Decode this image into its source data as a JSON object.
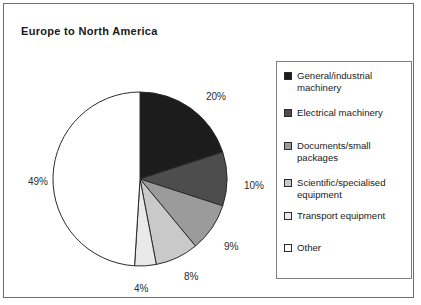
{
  "chart_data": {
    "type": "pie",
    "title": "Europe to North America",
    "xlabel": "",
    "ylabel": "",
    "legend_position": "right",
    "grid": false,
    "unit": "%",
    "categories": [
      "General/industrial machinery",
      "Electrical machinery",
      "Documents/small packages",
      "Scientific/specialised equipment",
      "Transport equipment",
      "Other"
    ],
    "values": [
      20,
      10,
      9,
      8,
      4,
      49
    ],
    "value_labels": [
      "20%",
      "10%",
      "9%",
      "8%",
      "4%",
      "49%"
    ],
    "colors": [
      "#1c1c1c",
      "#4d4d4d",
      "#9b9b9b",
      "#c9c9c9",
      "#e9e9e9",
      "#ffffff"
    ],
    "slice_outline": "#2b2b2b",
    "start_angle_deg": 0,
    "direction": "clockwise"
  },
  "chart": {
    "title": "Europe to North America",
    "slices": [
      {
        "label": "20%",
        "value": 20,
        "color": "#1c1c1c"
      },
      {
        "label": "10%",
        "value": 10,
        "color": "#4d4d4d"
      },
      {
        "label": "9%",
        "value": 9,
        "color": "#9b9b9b"
      },
      {
        "label": "8%",
        "value": 8,
        "color": "#c9c9c9"
      },
      {
        "label": "4%",
        "value": 4,
        "color": "#e9e9e9"
      },
      {
        "label": "49%",
        "value": 49,
        "color": "#ffffff"
      }
    ]
  },
  "legend": {
    "items": [
      {
        "label": "General/industrial machinery",
        "color": "#1c1c1c"
      },
      {
        "label": "Electrical machinery",
        "color": "#4d4d4d"
      },
      {
        "label": "Documents/small packages",
        "color": "#9b9b9b"
      },
      {
        "label": "Scientific/specialised equipment",
        "color": "#c9c9c9"
      },
      {
        "label": "Transport equipment",
        "color": "#e9e9e9"
      },
      {
        "label": "Other",
        "color": "#ffffff"
      }
    ]
  }
}
